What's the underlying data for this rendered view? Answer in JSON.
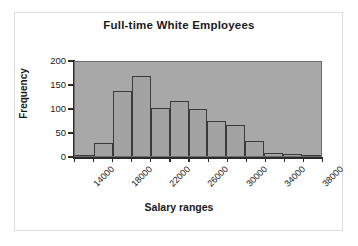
{
  "figure": {
    "title": "Full-time White Employees",
    "background": "#ffffff",
    "frame_color": "#dcdcdc"
  },
  "axes": {
    "y_title": "Frequency",
    "x_title": "Salary ranges",
    "y_ticks": [
      "0",
      "50",
      "100",
      "150",
      "200"
    ],
    "x_ticks": [
      "14000",
      "18000",
      "22000",
      "26000",
      "30000",
      "34000",
      "38000"
    ],
    "plot_background": "#a8a8a8",
    "bar_fill": "#a3a3a3",
    "bar_edge": "#3a3a3a"
  },
  "chart_data": {
    "type": "bar",
    "title": "Full-time White Employees",
    "xlabel": "Salary ranges",
    "ylabel": "Frequency",
    "ylim": [
      0,
      200
    ],
    "xlim": [
      14000,
      40000
    ],
    "bin_width": 2000,
    "grid": false,
    "legend": "none",
    "categories": [
      "14000",
      "16000",
      "18000",
      "20000",
      "22000",
      "24000",
      "26000",
      "28000",
      "30000",
      "32000",
      "34000",
      "36000",
      "38000"
    ],
    "values": [
      1,
      28,
      138,
      171,
      103,
      117,
      99,
      74,
      66,
      32,
      7,
      5,
      3
    ],
    "series": [
      {
        "name": "Frequency",
        "values": [
          1,
          28,
          138,
          171,
          103,
          117,
          99,
          74,
          66,
          32,
          7,
          5,
          3
        ]
      }
    ]
  }
}
